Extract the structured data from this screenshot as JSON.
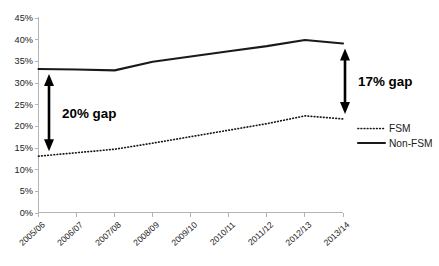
{
  "chart_data": {
    "type": "line",
    "title": "",
    "subtitle": "",
    "xlabel": "",
    "ylabel": "",
    "categories": [
      "2005/06",
      "2006/07",
      "2007/08",
      "2008/09",
      "2009/10",
      "2010/11",
      "2011/12",
      "2012/13",
      "2013/14"
    ],
    "series": [
      {
        "name": "FSM",
        "style": "dotted",
        "values": [
          13.0,
          13.8,
          14.6,
          16.0,
          17.5,
          19.0,
          20.5,
          22.3,
          21.6
        ]
      },
      {
        "name": "Non-FSM",
        "style": "solid",
        "values": [
          33.1,
          33.0,
          32.8,
          34.8,
          36.0,
          37.2,
          38.4,
          39.8,
          39.0
        ]
      }
    ],
    "ylim": [
      0,
      45
    ],
    "yticks": [
      0,
      5,
      10,
      15,
      20,
      25,
      30,
      35,
      40,
      45
    ],
    "ytick_labels": [
      "0%",
      "5%",
      "10%",
      "15%",
      "20%",
      "25%",
      "30%",
      "35%",
      "40%",
      "45%"
    ],
    "grid": false,
    "legend_position": "right",
    "annotations": [
      {
        "id": "left-gap",
        "label": "20% gap",
        "arrow": "double-vertical",
        "at_category": "2005/06",
        "from_value": 13.0,
        "to_value": 33.1
      },
      {
        "id": "right-gap",
        "label": "17% gap",
        "arrow": "double-vertical",
        "at_category": "2013/14",
        "from_value": 21.6,
        "to_value": 39.0
      }
    ]
  },
  "legend": {
    "items": [
      {
        "label": "FSM",
        "style": "dotted"
      },
      {
        "label": "Non-FSM",
        "style": "solid"
      }
    ]
  },
  "colors": {
    "series": "#1a1a1a",
    "axis": "#b4b4b4",
    "annotation": "#000000",
    "background": "#ffffff"
  }
}
